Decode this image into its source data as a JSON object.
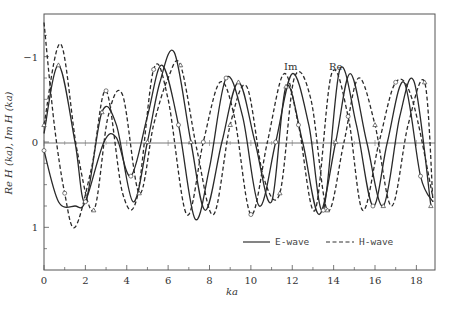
{
  "chart_data": {
    "type": "line",
    "title": "",
    "xlabel": "ka",
    "ylabel": "Re H (ka), Im H (ka)",
    "xlim": [
      0,
      18.9
    ],
    "ylim": [
      -1.5,
      1.5
    ],
    "x_ticks": [
      0,
      2,
      4,
      6,
      8,
      10,
      12,
      14,
      16,
      18
    ],
    "x_minor_ticks": [
      1,
      3,
      5,
      7,
      9,
      11,
      13,
      15,
      17
    ],
    "y_ticks": [
      -1,
      0,
      1
    ],
    "y_minor_ticks": [
      -1.25,
      -0.75,
      -0.5,
      -0.25,
      0.25,
      0.5,
      0.75,
      1.25
    ],
    "grid": false,
    "zero_line": true,
    "legend": {
      "position": "lower right",
      "entries": [
        {
          "label": "E-wave",
          "style": "solid"
        },
        {
          "label": "H-wave",
          "style": "dashed"
        }
      ]
    },
    "annotations": [
      {
        "text": "Im",
        "x": 12.0,
        "y": 0.95
      },
      {
        "text": "Re",
        "x": 14.1,
        "y": 0.95
      }
    ],
    "markers": {
      "circle": "calculated points",
      "triangle": "calculated points",
      "cross": "calculated points"
    },
    "series": [
      {
        "name": "E-wave Re",
        "style": "solid",
        "x": [
          0,
          0.7,
          1.5,
          2.0,
          2.9,
          3.5,
          4.2,
          5.0,
          5.7,
          6.5,
          7.3,
          8.0,
          8.8,
          9.6,
          10.4,
          11.2,
          12.0,
          12.8,
          13.5,
          14.3,
          15.1,
          15.9,
          16.6,
          17.4,
          18.2,
          18.8
        ],
        "y": [
          -0.1,
          -0.7,
          -0.75,
          -0.7,
          0.0,
          0.05,
          -0.4,
          0.3,
          0.9,
          0.2,
          -0.9,
          -0.3,
          0.75,
          0.3,
          -0.75,
          0.0,
          0.8,
          0.2,
          -0.8,
          0.85,
          0.2,
          -0.75,
          0.0,
          0.7,
          -0.4,
          -0.7
        ]
      },
      {
        "name": "E-wave Im",
        "style": "solid",
        "x": [
          0,
          0.7,
          1.5,
          2.0,
          2.8,
          3.5,
          4.3,
          5.0,
          5.6,
          6.3,
          7.1,
          7.8,
          8.6,
          9.4,
          10.2,
          11.0,
          11.7,
          12.5,
          13.3,
          14.1,
          14.8,
          15.6,
          16.4,
          17.2,
          17.9,
          18.7
        ],
        "y": [
          0.1,
          0.9,
          0.0,
          -0.7,
          0.35,
          0.2,
          -0.7,
          0.0,
          0.7,
          1.05,
          0.0,
          -0.8,
          0.0,
          0.7,
          0.0,
          -0.7,
          0.65,
          0.0,
          -0.85,
          0.0,
          0.8,
          0.0,
          -0.75,
          0.3,
          0.7,
          -0.75
        ]
      },
      {
        "name": "H-wave Re",
        "style": "dashed",
        "x": [
          0,
          0.5,
          1.0,
          1.5,
          2.3,
          3.0,
          3.8,
          4.5,
          5.3,
          6.0,
          6.9,
          7.7,
          8.5,
          9.2,
          10.0,
          10.8,
          11.6,
          12.3,
          13.1,
          13.9,
          14.7,
          15.4,
          16.2,
          17.0,
          17.8,
          18.8
        ],
        "y": [
          1.4,
          0.2,
          -0.6,
          -1.0,
          -0.3,
          0.6,
          -0.6,
          -0.65,
          0.85,
          0.5,
          -0.85,
          0.0,
          0.7,
          0.3,
          -0.85,
          0.0,
          0.8,
          0.2,
          -0.8,
          0.8,
          0.3,
          -0.8,
          0.0,
          0.7,
          0.5,
          -0.65
        ]
      },
      {
        "name": "H-wave Im",
        "style": "dashed",
        "x": [
          0,
          0.8,
          1.6,
          2.4,
          3.1,
          3.8,
          4.6,
          5.3,
          6.0,
          6.6,
          7.4,
          8.2,
          9.0,
          9.8,
          10.6,
          11.4,
          12.1,
          12.9,
          13.7,
          14.5,
          15.2,
          16.0,
          16.8,
          17.6,
          18.4,
          18.8
        ],
        "y": [
          0.2,
          1.15,
          -0.1,
          -0.8,
          0.3,
          0.55,
          -0.6,
          0.2,
          0.75,
          0.9,
          -0.1,
          -0.85,
          0.2,
          0.65,
          -0.4,
          -0.6,
          0.75,
          0.5,
          -0.8,
          0.0,
          0.75,
          0.2,
          -0.75,
          0.2,
          0.7,
          -0.7
        ]
      }
    ]
  },
  "axes": {
    "x_tick_labels": [
      "0",
      "2",
      "4",
      "6",
      "8",
      "10",
      "12",
      "14",
      "16",
      "18"
    ],
    "y_tick_labels": [
      "1",
      "0",
      "−1"
    ],
    "xlabel": "ka",
    "ylabel": "Re H (ka), Im H (ka)"
  },
  "legend": {
    "e_wave": "E-wave",
    "h_wave": "H-wave"
  },
  "annotations": {
    "im": "Im",
    "re": "Re"
  }
}
